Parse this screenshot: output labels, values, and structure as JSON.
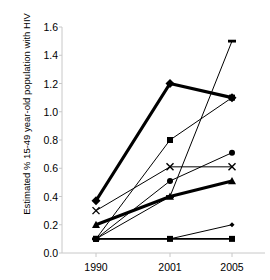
{
  "chart_data": {
    "type": "line",
    "title": "",
    "xlabel": "",
    "ylabel": "Estimated % 15-49 year-old population with HIV",
    "categories": [
      "1990",
      "2001",
      "2005"
    ],
    "x": [
      1990,
      2001,
      2005
    ],
    "ylim": [
      0.0,
      1.6
    ],
    "ytick_labels": [
      "0.0",
      "0.2",
      "0.4",
      "0.6",
      "0.8",
      "1.0",
      "1.2",
      "1.4",
      "1.6"
    ],
    "ytick_values": [
      0.0,
      0.2,
      0.4,
      0.6,
      0.8,
      1.0,
      1.2,
      1.4,
      1.6
    ],
    "xtick_labels": [
      "1990",
      "2001",
      "2005"
    ],
    "grid": false,
    "legend": "none",
    "series": [
      {
        "name": "series-1",
        "marker": "diamond",
        "marker_size": 9,
        "line_width": 3.2,
        "values": [
          0.37,
          1.2,
          1.1
        ]
      },
      {
        "name": "series-2",
        "marker": "square",
        "marker_size": 6,
        "line_width": 1.0,
        "values": [
          0.1,
          0.8,
          1.1
        ]
      },
      {
        "name": "series-3",
        "marker": "dash",
        "marker_size": 8,
        "line_width": 1.0,
        "values": [
          0.1,
          0.4,
          1.5
        ]
      },
      {
        "name": "series-4",
        "marker": "circle",
        "marker_size": 6,
        "line_width": 1.0,
        "values": [
          0.1,
          0.51,
          0.71
        ]
      },
      {
        "name": "series-5",
        "marker": "cross",
        "marker_size": 7,
        "line_width": 1.0,
        "values": [
          0.3,
          0.61,
          0.61
        ]
      },
      {
        "name": "series-6",
        "marker": "triangle",
        "marker_size": 8,
        "line_width": 3.0,
        "values": [
          0.2,
          0.4,
          0.51
        ]
      },
      {
        "name": "series-7",
        "marker": "diamond-small",
        "marker_size": 5,
        "line_width": 1.0,
        "values": [
          0.1,
          0.1,
          0.2
        ]
      },
      {
        "name": "series-8",
        "marker": "square",
        "marker_size": 6,
        "line_width": 1.6,
        "values": [
          0.1,
          0.1,
          0.1
        ]
      }
    ],
    "colors": {
      "line": "#000000",
      "marker": "#000000",
      "axis": "#c8c8c8",
      "background": "#ffffff",
      "text": "#000000"
    }
  }
}
